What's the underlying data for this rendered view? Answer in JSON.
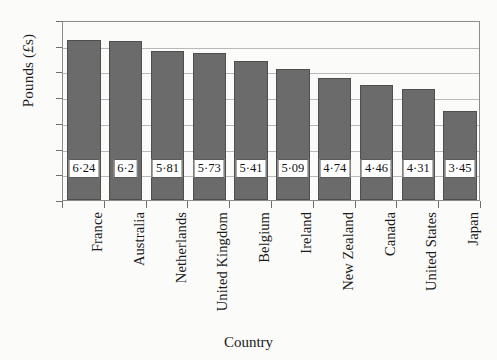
{
  "chart_data": {
    "type": "bar",
    "title": "",
    "xlabel": "Country",
    "ylabel": "Pounds (£s)",
    "ylabel_parts": {
      "prefix": "Pounds (",
      "currency": "£",
      "suffix": "s)"
    },
    "categories": [
      "France",
      "Australia",
      "Netherlands",
      "United Kingdom",
      "Belgium",
      "Ireland",
      "New Zealand",
      "Canada",
      "United States",
      "Japan"
    ],
    "values": [
      6.24,
      6.2,
      5.81,
      5.73,
      5.41,
      5.09,
      4.74,
      4.46,
      4.31,
      3.45
    ],
    "value_labels": [
      "6·24",
      "6·2",
      "5·81",
      "5·73",
      "5·41",
      "5·09",
      "4·74",
      "4·46",
      "4·31",
      "3·45"
    ],
    "ylim": [
      0,
      7
    ],
    "yticks": [
      0,
      1,
      2,
      3,
      4,
      5,
      6,
      7
    ],
    "ytick_labels": [
      "0",
      "1",
      "2",
      "3",
      "4",
      "5",
      "6",
      "7"
    ],
    "grid": true,
    "grid_axis": "y",
    "legend": "none",
    "bar_color": "#6b6b6b",
    "bar_edge_color": "#4e4e4e",
    "gridline_color": "#b9b9b9",
    "frame_color": "#8c8c8c",
    "background_color": "#fbfbf9",
    "label_box_background": "#ffffff",
    "label_box_border": "#5a5a5a"
  }
}
